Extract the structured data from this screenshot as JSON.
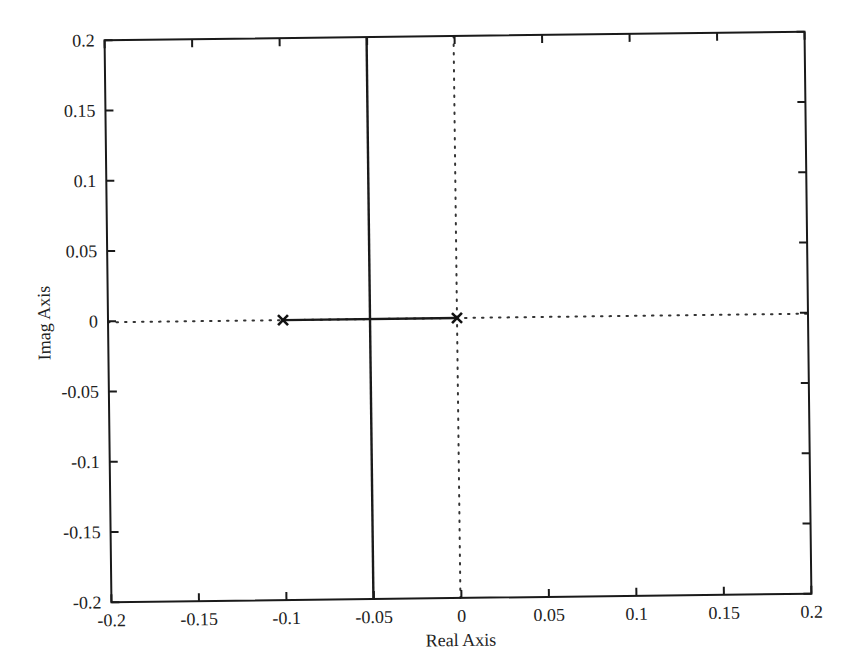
{
  "chart_data": {
    "type": "scatter",
    "subtype": "root-locus",
    "title": "",
    "xlabel": "Real Axis",
    "ylabel": "Imag Axis",
    "xlim": [
      -0.2,
      0.2
    ],
    "ylim": [
      -0.2,
      0.2
    ],
    "grid": false,
    "legend": null,
    "x_ticks": [
      "-0.2",
      "-0.15",
      "-0.1",
      "-0.05",
      "0",
      "0.05",
      "0.1",
      "0.15",
      "0.2"
    ],
    "y_ticks": [
      "0.2",
      "0.15",
      "0.1",
      "0.05",
      "0",
      "-0.05",
      "-0.1",
      "-0.15",
      "-0.2"
    ],
    "poles": [
      {
        "re": -0.1,
        "im": 0
      },
      {
        "re": 0,
        "im": 0
      }
    ],
    "series": [
      {
        "name": "real-axis segment",
        "style": "solid",
        "x": [
          -0.1,
          0
        ],
        "y": [
          0,
          0
        ]
      },
      {
        "name": "breakaway branches",
        "style": "solid",
        "x": [
          -0.05,
          -0.05
        ],
        "y": [
          -0.2,
          0.2
        ]
      },
      {
        "name": "real axis reference",
        "style": "dotted",
        "x": [
          -0.2,
          0.2
        ],
        "y": [
          0,
          0
        ]
      },
      {
        "name": "imag axis reference",
        "style": "dotted",
        "x": [
          0,
          0
        ],
        "y": [
          -0.2,
          0.2
        ]
      }
    ],
    "breakaway_point": {
      "re": -0.05,
      "im": 0
    }
  }
}
